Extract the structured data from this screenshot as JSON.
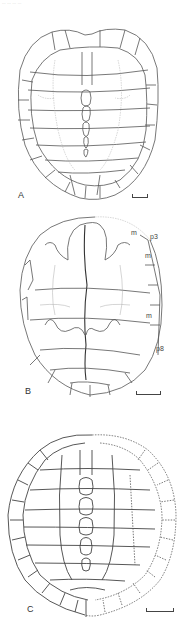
{
  "caption": "... ... ... ...",
  "figures": [
    {
      "label": "A",
      "description": "carapace, dorsal view",
      "scale_bar": true
    },
    {
      "label": "B",
      "description": "fossil plastron/carapace with annotations",
      "scale_bar": true,
      "annotations": [
        "m",
        "p3",
        "m",
        "m",
        "p8"
      ]
    },
    {
      "label": "C",
      "description": "reconstructed carapace with dotted restored regions",
      "scale_bar": true
    }
  ],
  "colors": {
    "line": "#555555",
    "light_line": "#aaaaaa",
    "label": "#333333"
  }
}
